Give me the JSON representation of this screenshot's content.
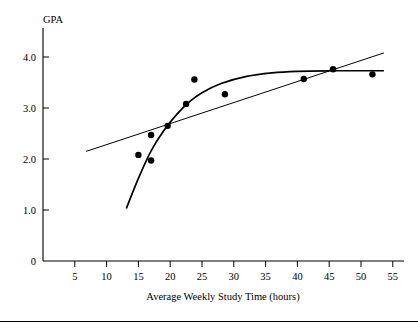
{
  "chart_data": {
    "type": "scatter",
    "title": "",
    "xlabel": "Average Weekly Study Time (hours)",
    "ylabel": "GPA",
    "xlim": [
      0,
      57
    ],
    "ylim": [
      0,
      4.35
    ],
    "grid": false,
    "legend": "none",
    "xticks": [
      5,
      10,
      15,
      20,
      25,
      30,
      35,
      40,
      45,
      50,
      55
    ],
    "xtick_labels": [
      "5",
      "10",
      "15",
      "20",
      "25",
      "30",
      "35",
      "40",
      "45",
      "50",
      "55"
    ],
    "yticks": [
      0,
      1.0,
      2.0,
      3.0,
      4.0
    ],
    "ytick_labels": [
      "0",
      "1.0",
      "2.0",
      "3.0",
      "4.0"
    ],
    "points": [
      {
        "x": 15.0,
        "y": 2.08
      },
      {
        "x": 17.0,
        "y": 2.47
      },
      {
        "x": 17.0,
        "y": 1.97
      },
      {
        "x": 19.6,
        "y": 2.65
      },
      {
        "x": 22.5,
        "y": 3.08
      },
      {
        "x": 23.8,
        "y": 3.56
      },
      {
        "x": 28.6,
        "y": 3.27
      },
      {
        "x": 41.0,
        "y": 3.57
      },
      {
        "x": 45.6,
        "y": 3.76
      },
      {
        "x": 51.8,
        "y": 3.66
      }
    ],
    "series": [
      {
        "name": "linear fit",
        "type": "line",
        "x": [
          6.8,
          53.6
        ],
        "y": [
          2.15,
          4.08
        ]
      },
      {
        "name": "nonlinear fit",
        "type": "curve",
        "x": [
          13.1,
          15.0,
          17.0,
          19.0,
          21.0,
          23.0,
          25.0,
          28.0,
          32.0,
          36.0,
          40.0,
          45.0,
          50.0,
          53.6
        ],
        "y": [
          1.03,
          1.62,
          2.16,
          2.56,
          2.87,
          3.12,
          3.3,
          3.48,
          3.62,
          3.69,
          3.72,
          3.73,
          3.73,
          3.73
        ]
      }
    ]
  },
  "axes": {
    "x_axis_name": "x-axis",
    "y_axis_name": "y-axis"
  }
}
